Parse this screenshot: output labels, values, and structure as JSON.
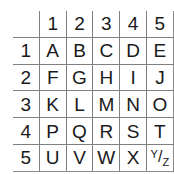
{
  "figure": {
    "name": "polybius-square",
    "corner_label": "",
    "column_headers": [
      "1",
      "2",
      "3",
      "4",
      "5"
    ],
    "row_headers": [
      "1",
      "2",
      "3",
      "4",
      "5"
    ],
    "rows": [
      {
        "header": "1",
        "cells": [
          "A",
          "B",
          "C",
          "D",
          "E"
        ]
      },
      {
        "header": "2",
        "cells": [
          "F",
          "G",
          "H",
          "I",
          "J"
        ]
      },
      {
        "header": "3",
        "cells": [
          "K",
          "L",
          "M",
          "N",
          "O"
        ]
      },
      {
        "header": "4",
        "cells": [
          "P",
          "Q",
          "R",
          "S",
          "T"
        ]
      },
      {
        "header": "5",
        "cells": [
          "U",
          "V",
          "W",
          "X",
          "Y/Z"
        ]
      }
    ],
    "combined_cell": {
      "numerator": "Y",
      "slash": "/",
      "denominator": "Z"
    },
    "highlight": {
      "highlighted_column_header": "3",
      "highlighted_row_header": "2",
      "intersection_letter": "H",
      "light_color": "#d4d4d4",
      "dark_color": "#9e9e9e",
      "grid_line_color": "#808080",
      "text_color": "#1a1a1a",
      "background_color": "#ffffff"
    }
  }
}
